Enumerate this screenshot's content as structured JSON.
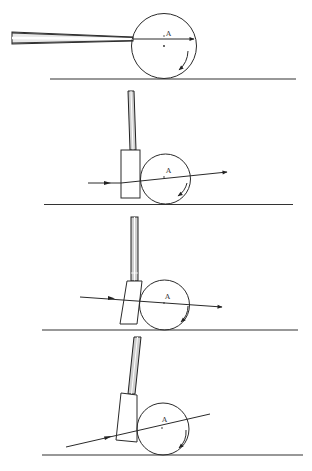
{
  "figure": {
    "type": "physics-diagram",
    "panels": [
      {
        "id": 1,
        "striker": "cue",
        "ball_center_label": "A",
        "force_line": "horizontal, above center",
        "rotation_arrow": "clockwise (topspin)"
      },
      {
        "id": 2,
        "striker": "vertical block",
        "ball_center_label": "A",
        "force_line": "slightly rising, above center",
        "rotation_arrow": "clockwise"
      },
      {
        "id": 3,
        "striker": "tilted block",
        "ball_center_label": "A",
        "force_line": "slightly descending, through center",
        "rotation_arrow": "clockwise"
      },
      {
        "id": 4,
        "striker": "tilted block",
        "ball_center_label": "A",
        "force_line": "steeply rising, through center",
        "rotation_arrow": "clockwise"
      }
    ],
    "labels": {
      "p1": "A",
      "p2": "A",
      "p3": "A",
      "p4": "A"
    }
  }
}
